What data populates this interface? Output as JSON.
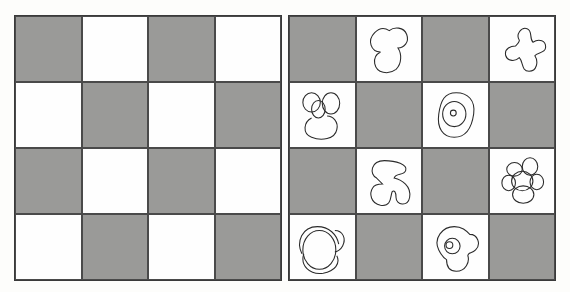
{
  "figure": {
    "colors": {
      "gray": "#9a9a98",
      "white": "#fefefe",
      "line": "#3a3a3a"
    },
    "left_board": {
      "rows": [
        [
          "gray",
          "white",
          "gray",
          "white"
        ],
        [
          "white",
          "gray",
          "white",
          "gray"
        ],
        [
          "gray",
          "white",
          "gray",
          "white"
        ],
        [
          "white",
          "gray",
          "white",
          "gray"
        ]
      ]
    },
    "right_board": {
      "rows": [
        [
          "gray",
          "white",
          "gray",
          "white"
        ],
        [
          "white",
          "gray",
          "white",
          "gray"
        ],
        [
          "gray",
          "white",
          "gray",
          "white"
        ],
        [
          "white",
          "gray",
          "white",
          "gray"
        ]
      ],
      "shapes": [
        {
          "row": 0,
          "col": 1,
          "icon": "three-lobe-blob-icon"
        },
        {
          "row": 0,
          "col": 3,
          "icon": "four-petal-propeller-icon"
        },
        {
          "row": 1,
          "col": 0,
          "icon": "clover-with-center-oval-icon"
        },
        {
          "row": 1,
          "col": 2,
          "icon": "concentric-rings-icon"
        },
        {
          "row": 2,
          "col": 1,
          "icon": "three-lobe-trefoil-icon"
        },
        {
          "row": 2,
          "col": 3,
          "icon": "six-petal-flower-icon"
        },
        {
          "row": 3,
          "col": 0,
          "icon": "overlapping-circles-blob-icon"
        },
        {
          "row": 3,
          "col": 2,
          "icon": "blob-with-eye-icon"
        }
      ]
    }
  }
}
